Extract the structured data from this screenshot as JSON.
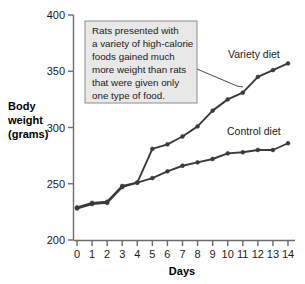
{
  "chart_data": {
    "type": "line",
    "title": "",
    "xlabel": "Days",
    "ylabel": "Body weight (grams)",
    "ylabel_lines": [
      "Body",
      "weight",
      "(grams)"
    ],
    "x": [
      0,
      1,
      2,
      3,
      4,
      5,
      6,
      7,
      8,
      9,
      10,
      11,
      12,
      13,
      14
    ],
    "xticklabels": [
      "0",
      "1",
      "2",
      "3",
      "4",
      "5",
      "6",
      "7",
      "8",
      "9",
      "10",
      "11",
      "12",
      "13",
      "14"
    ],
    "yticks": [
      200,
      250,
      300,
      350,
      400
    ],
    "yticklabels": [
      "200",
      "250",
      "300",
      "350",
      "400"
    ],
    "xlim": [
      0,
      14
    ],
    "ylim": [
      200,
      400
    ],
    "grid": false,
    "legend_position": "inline-labels",
    "series": [
      {
        "name": "Variety diet",
        "color": "#3a3a3a",
        "values": [
          229,
          233,
          234,
          248,
          251,
          281,
          285,
          292,
          301,
          315,
          325,
          331,
          345,
          351,
          357
        ]
      },
      {
        "name": "Control diet",
        "color": "#3a3a3a",
        "values": [
          228,
          232,
          233,
          247,
          251,
          255,
          261,
          266,
          269,
          272,
          277,
          278,
          280,
          280,
          286
        ]
      }
    ],
    "annotations": [
      {
        "id": "callout",
        "lines": [
          "Rats presented with",
          "a variety of high-calorie",
          "foods gained much",
          "more weight than rats",
          "that were given only",
          "one type of food."
        ],
        "text": "Rats presented with a variety of high-calorie foods gained much more weight than rats that were given only one type of food.",
        "box_fill": "#e8e8e8",
        "box_border": "#8c8c8c",
        "points_to": "Variety diet"
      }
    ]
  }
}
